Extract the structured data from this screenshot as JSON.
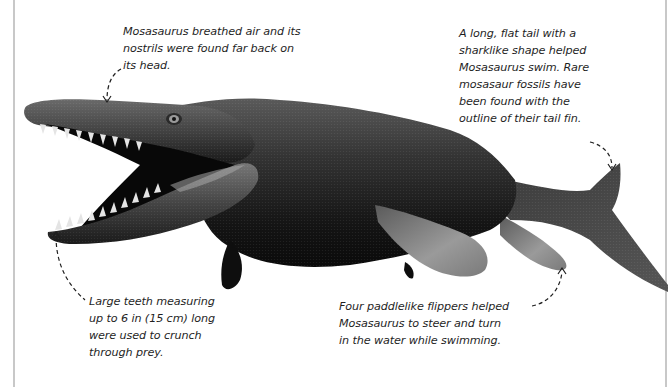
{
  "figure": {
    "subject": "Mosasaurus",
    "colors": {
      "background": "#ffffff",
      "body_dark": "#1a1a1a",
      "body_mid": "#3c3c3c",
      "flipper_light": "#8a8a8a",
      "mouth_interior": "#0a0a0a",
      "teeth": "#e8e8e8",
      "text": "#1f1f1f",
      "margin_line": "#c8c8c8"
    }
  },
  "annotations": {
    "nostrils": {
      "lines": [
        "Mosasaurus breathed air and its",
        "nostrils were found far back on",
        "its head."
      ]
    },
    "tail": {
      "lines": [
        "A long, flat tail with a",
        "sharklike shape helped",
        "Mosasaurus swim. Rare",
        "mosasaur fossils have",
        "been found with the",
        "outline of their tail fin."
      ]
    },
    "teeth": {
      "lines": [
        "Large teeth measuring",
        "up to 6 in (15 cm) long",
        "were used to crunch",
        "through prey."
      ]
    },
    "flippers": {
      "lines": [
        "Four paddlelike flippers helped",
        "Mosasaurus to steer and turn",
        "in the water while swimming."
      ]
    }
  }
}
